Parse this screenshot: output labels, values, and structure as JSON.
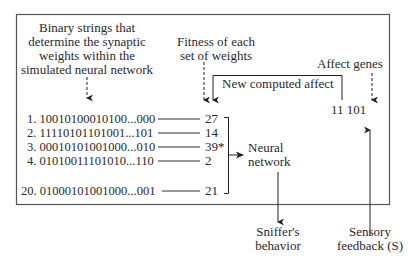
{
  "diagram": {
    "binary_strings_label": [
      "Binary strings that",
      "determine the synaptic",
      "weights within the",
      "simulated neural network"
    ],
    "fitness_label": [
      "Fitness of each",
      "set of weights"
    ],
    "new_affect_label": "New computed affect",
    "affect_genes_label": "Affect genes",
    "affect_genes_value": "11 101",
    "population": [
      {
        "label": "1. 10010100010100...000",
        "fitness": "27"
      },
      {
        "label": "2. 11110101101001...101",
        "fitness": "14"
      },
      {
        "label": "3. 00010101001000...010",
        "fitness": "39*"
      },
      {
        "label": "4. 01010011101010...110",
        "fitness": "2"
      },
      {
        "label": "20. 01000101001000...001",
        "fitness": "21"
      }
    ],
    "neural_network_label": [
      "Neural",
      "network"
    ],
    "sniffer_behavior_label": [
      "Sniffer's",
      "behavior"
    ],
    "sensory_feedback_label": [
      "Sensory",
      "feedback (S)"
    ],
    "colors": {
      "ink": "#2a2a2a",
      "frame": "#555555"
    }
  }
}
